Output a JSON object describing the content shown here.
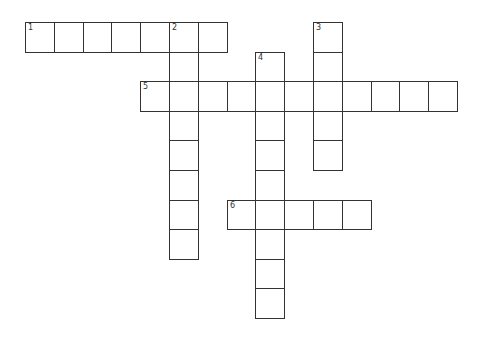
{
  "puzzle": {
    "grid_origin": {
      "x": 25,
      "y": 22
    },
    "cell_size": {
      "w": 28.8,
      "h": 29.6
    },
    "entries": [
      {
        "number": "1",
        "direction": "across",
        "row": 0,
        "col": 0,
        "length": 7
      },
      {
        "number": "2",
        "direction": "down",
        "row": 0,
        "col": 5,
        "length": 8
      },
      {
        "number": "3",
        "direction": "down",
        "row": 0,
        "col": 10,
        "length": 5
      },
      {
        "number": "4",
        "direction": "down",
        "row": 1,
        "col": 8,
        "length": 9
      },
      {
        "number": "5",
        "direction": "across",
        "row": 2,
        "col": 4,
        "length": 11
      },
      {
        "number": "6",
        "direction": "across",
        "row": 6,
        "col": 7,
        "length": 5
      }
    ]
  }
}
